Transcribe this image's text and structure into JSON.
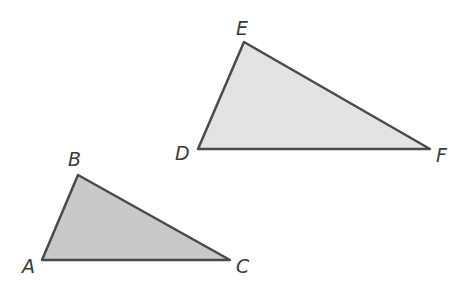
{
  "diagram": {
    "type": "geometry-figure",
    "stroke_color": "#4a4a4a",
    "triangles": [
      {
        "name": "ABC",
        "fill": "#c9c9c9",
        "vertices": [
          {
            "label": "A",
            "x": 42,
            "y": 260,
            "lx": 22,
            "ly": 273
          },
          {
            "label": "B",
            "x": 78,
            "y": 175,
            "lx": 68,
            "ly": 166
          },
          {
            "label": "C",
            "x": 230,
            "y": 260,
            "lx": 236,
            "ly": 273
          }
        ]
      },
      {
        "name": "DEF",
        "fill": "#e3e3e3",
        "vertices": [
          {
            "label": "D",
            "x": 198,
            "y": 149,
            "lx": 175,
            "ly": 160
          },
          {
            "label": "E",
            "x": 244,
            "y": 42,
            "lx": 236,
            "ly": 35
          },
          {
            "label": "F",
            "x": 430,
            "y": 149,
            "lx": 436,
            "ly": 162
          }
        ]
      }
    ]
  }
}
